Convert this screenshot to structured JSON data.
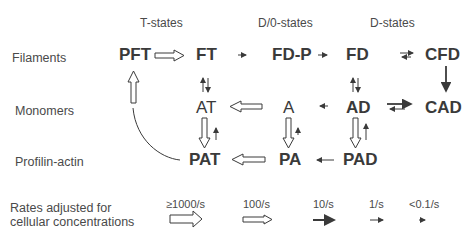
{
  "column_headers": [
    "T-states",
    "D/0-states",
    "D-states"
  ],
  "row_labels": [
    "Filaments",
    "Monomers",
    "Profilin-actin"
  ],
  "nodes": {
    "PFT": "PFT",
    "FT": "FT",
    "FDP": "FD-P",
    "FD": "FD",
    "CFD": "CFD",
    "AT": "AT",
    "A": "A",
    "AD": "AD",
    "CAD": "CAD",
    "PAT": "PAT",
    "PA": "PA",
    "PAD": "PAD"
  },
  "legend": {
    "label_line1": "Rates adjusted for",
    "label_line2": "cellular concentrations",
    "rates": [
      ">=1000/s",
      "100/s",
      "10/s",
      "1/s",
      "<0.1/s"
    ],
    "rate_display": [
      "≥1000/s",
      "100/s",
      "10/s",
      "1/s",
      "<0.1/s"
    ]
  },
  "colors": {
    "ink": "#3a3a3a",
    "background": "#ffffff"
  }
}
